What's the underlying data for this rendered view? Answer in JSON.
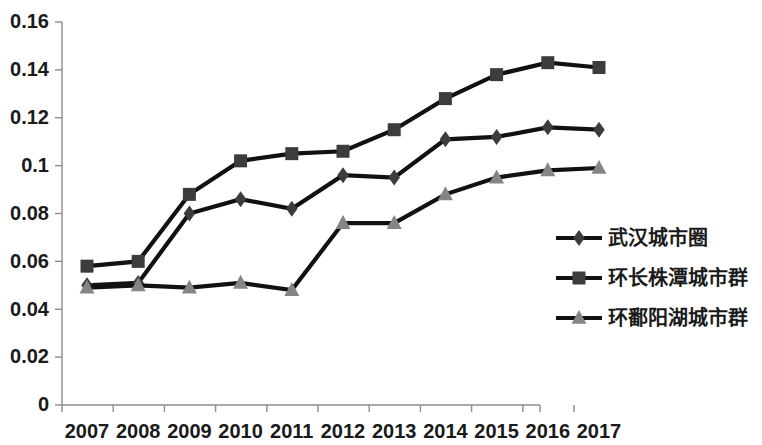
{
  "chart_data": {
    "type": "line",
    "title": "",
    "subtitle": "",
    "xlabel": "",
    "ylabel": "",
    "categories": [
      "2007",
      "2008",
      "2009",
      "2010",
      "2011",
      "2012",
      "2013",
      "2014",
      "2015",
      "2016",
      "2017"
    ],
    "x_tick_labels": [
      "2007",
      "2008",
      "2009",
      "2010",
      "2011",
      "2012",
      "2013",
      "2014",
      "2015",
      "2016",
      "2017"
    ],
    "y_tick_labels": [
      "0",
      "0.02",
      "0.04",
      "0.06",
      "0.08",
      "0.1",
      "0.12",
      "0.14",
      "0.16"
    ],
    "y_tick_values": [
      0,
      0.02,
      0.04,
      0.06,
      0.08,
      0.1,
      0.12,
      0.14,
      0.16
    ],
    "ylim": [
      0,
      0.16
    ],
    "grid": false,
    "legend_position": "right",
    "series": [
      {
        "name": "武汉城市圈",
        "marker": "diamond",
        "color": "#3c3c3c",
        "line_color": "#111111",
        "values": [
          0.05,
          0.051,
          0.08,
          0.086,
          0.082,
          0.096,
          0.095,
          0.111,
          0.112,
          0.116,
          0.115
        ]
      },
      {
        "name": "环长株潭城市群",
        "marker": "square",
        "color": "#3c3c3c",
        "line_color": "#111111",
        "values": [
          0.058,
          0.06,
          0.088,
          0.102,
          0.105,
          0.106,
          0.115,
          0.128,
          0.138,
          0.143,
          0.141
        ]
      },
      {
        "name": "环鄱阳湖城市群",
        "marker": "triangle",
        "color": "#858585",
        "line_color": "#111111",
        "values": [
          0.049,
          0.05,
          0.049,
          0.051,
          0.048,
          0.076,
          0.076,
          0.088,
          0.095,
          0.098,
          0.099
        ]
      }
    ],
    "legend": [
      {
        "label": "武汉城市圈",
        "marker": "diamond",
        "color": "#3c3c3c"
      },
      {
        "label": "环长株潭城市群",
        "marker": "square",
        "color": "#3c3c3c"
      },
      {
        "label": "环鄱阳湖城市群",
        "marker": "triangle",
        "color": "#858585"
      }
    ],
    "colors": {
      "axis": "#8c8c8c",
      "line": "#111111",
      "text": "#1a1a1a",
      "background": "#ffffff",
      "marker_dark": "#3c3c3c",
      "marker_light": "#858585"
    }
  }
}
